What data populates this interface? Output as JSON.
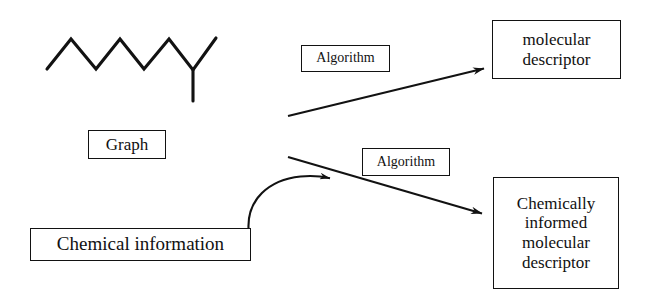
{
  "diagram": {
    "canvas": {
      "width": 646,
      "height": 304
    },
    "colors": {
      "background": "#ffffff",
      "stroke": "#121212",
      "text": "#111111"
    },
    "nodes": {
      "graph": {
        "label": "Graph"
      },
      "algorithm_top": {
        "label": "Algorithm"
      },
      "algorithm_bottom": {
        "label": "Algorithm"
      },
      "molecular_descriptor": {
        "label": "molecular\ndescriptor"
      },
      "chemical_information": {
        "label": "Chemical information"
      },
      "chemically_informed_descriptor": {
        "label": "Chemically\ninformed\nmolecular\ndescriptor"
      }
    },
    "structure": {
      "name": "alkane-skeleton-icon",
      "description": "branched zigzag hydrocarbon skeleton line drawing",
      "backbone_points": "47,69 71,39 96,69 120,39 144,69 169,39 193,70 216,38",
      "branch_points": "193,70 193,101"
    },
    "arrows": {
      "graph_to_molecular_descriptor": {
        "name": "arrow-graph-to-molecular-descriptor",
        "style": "straight",
        "from": "288,116",
        "to": "486,68"
      },
      "chemical_information_curve": {
        "name": "arrow-chemical-information-curve",
        "style": "curved",
        "from": "248,228",
        "to": "336,179"
      },
      "to_chemically_informed_descriptor": {
        "name": "arrow-to-chemically-informed-descriptor",
        "style": "straight",
        "from": "288,157",
        "to": "488,216"
      }
    }
  }
}
